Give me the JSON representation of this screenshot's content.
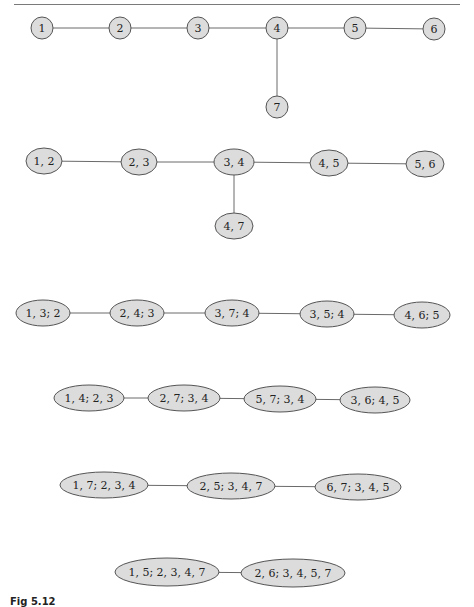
{
  "figure": {
    "caption_visible_fragment": "Fig 5.12",
    "colors": {
      "node_fill": "#dcdcdc",
      "node_stroke": "#555555",
      "edge": "#6a6a6a",
      "rule": "#7a7a7a"
    }
  },
  "trees": [
    {
      "id": "original-tree",
      "shape": "circle",
      "nodes": [
        {
          "label": "1",
          "x": 42,
          "y": 28,
          "rx": 11,
          "ry": 11
        },
        {
          "label": "2",
          "x": 120,
          "y": 28,
          "rx": 11,
          "ry": 11
        },
        {
          "label": "3",
          "x": 198,
          "y": 28,
          "rx": 11,
          "ry": 11
        },
        {
          "label": "4",
          "x": 277,
          "y": 28,
          "rx": 11,
          "ry": 11
        },
        {
          "label": "5",
          "x": 355,
          "y": 28,
          "rx": 11,
          "ry": 11
        },
        {
          "label": "6",
          "x": 434,
          "y": 29,
          "rx": 11,
          "ry": 11
        },
        {
          "label": "7",
          "x": 277,
          "y": 107,
          "rx": 11,
          "ry": 11
        }
      ],
      "edges": [
        [
          0,
          1
        ],
        [
          1,
          2
        ],
        [
          2,
          3
        ],
        [
          3,
          4
        ],
        [
          4,
          5
        ],
        [
          3,
          6
        ]
      ]
    },
    {
      "id": "line-graph",
      "shape": "ellipse",
      "nodes": [
        {
          "label": "1, 2",
          "x": 44,
          "y": 161,
          "rx": 18,
          "ry": 13
        },
        {
          "label": "2, 3",
          "x": 139,
          "y": 162,
          "rx": 18,
          "ry": 13
        },
        {
          "label": "3, 4",
          "x": 234,
          "y": 162,
          "rx": 20,
          "ry": 13
        },
        {
          "label": "4, 5",
          "x": 329,
          "y": 163,
          "rx": 19,
          "ry": 13
        },
        {
          "label": "5, 6",
          "x": 425,
          "y": 164,
          "rx": 19,
          "ry": 13
        },
        {
          "label": "4, 7",
          "x": 234,
          "y": 226,
          "rx": 19,
          "ry": 13
        }
      ],
      "edges": [
        [
          0,
          1
        ],
        [
          1,
          2
        ],
        [
          2,
          3
        ],
        [
          3,
          4
        ],
        [
          2,
          5
        ]
      ]
    },
    {
      "id": "level-2",
      "shape": "ellipse",
      "nodes": [
        {
          "label": "1, 3; 2",
          "x": 43,
          "y": 313,
          "rx": 27,
          "ry": 13
        },
        {
          "label": "2, 4; 3",
          "x": 137,
          "y": 313,
          "rx": 27,
          "ry": 13
        },
        {
          "label": "3, 7; 4",
          "x": 232,
          "y": 313,
          "rx": 27,
          "ry": 13
        },
        {
          "label": "3, 5; 4",
          "x": 327,
          "y": 314,
          "rx": 27,
          "ry": 13
        },
        {
          "label": "4, 6; 5",
          "x": 422,
          "y": 315,
          "rx": 28,
          "ry": 13
        }
      ],
      "edges": [
        [
          0,
          1
        ],
        [
          1,
          2
        ],
        [
          2,
          3
        ],
        [
          3,
          4
        ]
      ]
    },
    {
      "id": "level-3",
      "shape": "ellipse",
      "nodes": [
        {
          "label": "1, 4; 2, 3",
          "x": 89,
          "y": 398,
          "rx": 35,
          "ry": 13
        },
        {
          "label": "2, 7; 3, 4",
          "x": 184,
          "y": 398,
          "rx": 36,
          "ry": 13
        },
        {
          "label": "5, 7; 3, 4",
          "x": 280,
          "y": 399,
          "rx": 36,
          "ry": 13
        },
        {
          "label": "3, 6; 4, 5",
          "x": 375,
          "y": 400,
          "rx": 35,
          "ry": 13
        }
      ],
      "edges": [
        [
          0,
          1
        ],
        [
          1,
          2
        ],
        [
          2,
          3
        ]
      ]
    },
    {
      "id": "level-4",
      "shape": "ellipse",
      "nodes": [
        {
          "label": "1, 7; 2, 3, 4",
          "x": 104,
          "y": 485,
          "rx": 44,
          "ry": 13
        },
        {
          "label": "2, 5; 3, 4, 7",
          "x": 231,
          "y": 486,
          "rx": 44,
          "ry": 13
        },
        {
          "label": "6, 7; 3, 4, 5",
          "x": 358,
          "y": 487,
          "rx": 43,
          "ry": 13
        }
      ],
      "edges": [
        [
          0,
          1
        ],
        [
          1,
          2
        ]
      ]
    },
    {
      "id": "level-5",
      "shape": "ellipse",
      "nodes": [
        {
          "label": "1, 5; 2, 3, 4, 7",
          "x": 167,
          "y": 572,
          "rx": 52,
          "ry": 14
        },
        {
          "label": "2, 6; 3, 4, 5, 7",
          "x": 293,
          "y": 573,
          "rx": 52,
          "ry": 14
        }
      ],
      "edges": [
        [
          0,
          1
        ]
      ]
    }
  ]
}
